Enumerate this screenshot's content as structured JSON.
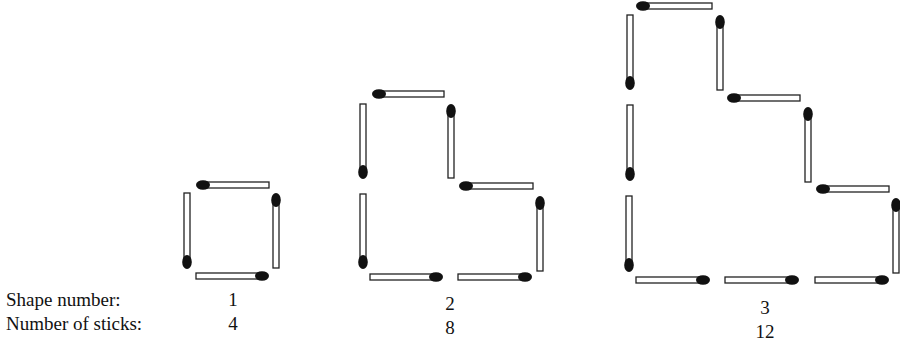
{
  "labels": {
    "shape_number": "Shape number:",
    "number_of_sticks": "Number of sticks:"
  },
  "shapes": [
    {
      "shape_number": "1",
      "sticks": "4",
      "label_x": 233,
      "matches": [
        {
          "orient": "h",
          "x1": 203,
          "x2": 269,
          "y": 185,
          "head": "start"
        },
        {
          "orient": "v",
          "x": 187,
          "y1": 193,
          "y2": 262,
          "head": "end"
        },
        {
          "orient": "v",
          "x": 276,
          "y1": 200,
          "y2": 268,
          "head": "start"
        },
        {
          "orient": "h",
          "x1": 196,
          "x2": 262,
          "y": 276,
          "head": "end"
        }
      ]
    },
    {
      "shape_number": "2",
      "sticks": "8",
      "label_x": 450,
      "matches": [
        {
          "orient": "h",
          "x1": 379,
          "x2": 444,
          "y": 94,
          "head": "start"
        },
        {
          "orient": "v",
          "x": 363,
          "y1": 104,
          "y2": 172,
          "head": "end"
        },
        {
          "orient": "v",
          "x": 363,
          "y1": 194,
          "y2": 262,
          "head": "end"
        },
        {
          "orient": "v",
          "x": 451,
          "y1": 111,
          "y2": 178,
          "head": "start"
        },
        {
          "orient": "h",
          "x1": 466,
          "x2": 533,
          "y": 186,
          "head": "start"
        },
        {
          "orient": "v",
          "x": 540,
          "y1": 203,
          "y2": 271,
          "head": "start"
        },
        {
          "orient": "h",
          "x1": 370,
          "x2": 436,
          "y": 277,
          "head": "end"
        },
        {
          "orient": "h",
          "x1": 458,
          "x2": 525,
          "y": 277,
          "head": "end"
        }
      ]
    },
    {
      "shape_number": "3",
      "sticks": "12",
      "label_x": 765,
      "matches": [
        {
          "orient": "h",
          "x1": 643,
          "x2": 712,
          "y": 6,
          "head": "start"
        },
        {
          "orient": "v",
          "x": 630,
          "y1": 15,
          "y2": 83,
          "head": "end"
        },
        {
          "orient": "v",
          "x": 630,
          "y1": 105,
          "y2": 174,
          "head": "end"
        },
        {
          "orient": "v",
          "x": 629,
          "y1": 196,
          "y2": 265,
          "head": "end"
        },
        {
          "orient": "v",
          "x": 720,
          "y1": 22,
          "y2": 90,
          "head": "start"
        },
        {
          "orient": "h",
          "x1": 734,
          "x2": 800,
          "y": 98,
          "head": "start"
        },
        {
          "orient": "v",
          "x": 808,
          "y1": 114,
          "y2": 182,
          "head": "start"
        },
        {
          "orient": "h",
          "x1": 823,
          "x2": 889,
          "y": 189,
          "head": "start"
        },
        {
          "orient": "v",
          "x": 896,
          "y1": 205,
          "y2": 273,
          "head": "start"
        },
        {
          "orient": "h",
          "x1": 636,
          "x2": 703,
          "y": 280,
          "head": "end"
        },
        {
          "orient": "h",
          "x1": 725,
          "x2": 792,
          "y": 280,
          "head": "end"
        },
        {
          "orient": "h",
          "x1": 815,
          "x2": 882,
          "y": 280,
          "head": "end"
        }
      ]
    }
  ],
  "colors": {
    "stick_fill": "#ffffff",
    "stick_stroke": "#222222",
    "head_fill": "#111111"
  }
}
